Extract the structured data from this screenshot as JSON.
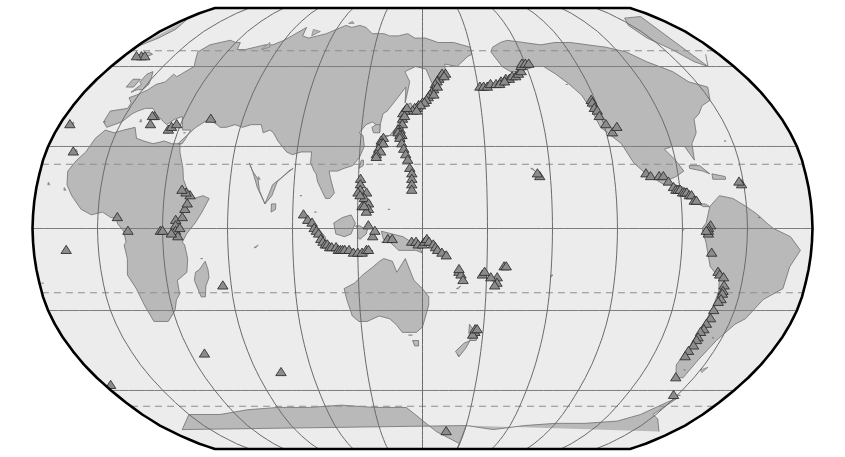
{
  "map": {
    "title": "World map of volcano locations",
    "projection": "Robinson",
    "center_longitude": 150,
    "background_color": "#ffffff",
    "ocean_color": "#ececec",
    "land_color": "#b9b9b9",
    "land_outline_color": "#6e6e6e",
    "frame_color": "#000000",
    "graticule_color": "#6a6a6a",
    "dashed_graticule_color": "#8d8d8d",
    "marker_fill_color": "#8c8c8c",
    "marker_outline_color": "#2b2b2b",
    "marker_symbol": "triangle",
    "marker_meaning": "volcano",
    "labels_visible": false,
    "legend_visible": false,
    "axis_tick_labels_visible": false
  },
  "graticule": {
    "latitude_interval_degrees": 30,
    "longitude_interval_degrees": 30,
    "solid_latitudes": [
      -60,
      -30,
      0,
      30,
      60
    ],
    "dashed_latitudes": [
      -66.5,
      -23.5,
      23.5,
      66.5
    ],
    "dashed_latitude_names": [
      "Antarctic Circle",
      "Tropic of Capricorn",
      "Tropic of Cancer",
      "Arctic Circle"
    ],
    "longitudes": [
      -180,
      -150,
      -120,
      -90,
      -60,
      -30,
      0,
      30,
      60,
      90,
      120,
      150,
      180
    ]
  },
  "chart_data": {
    "type": "scatter",
    "xlabel": "Longitude",
    "ylabel": "Latitude",
    "xlim": [
      -30,
      330
    ],
    "ylim": [
      -90,
      90
    ],
    "grid": true,
    "legend": "",
    "series": [
      {
        "name": "Volcanoes",
        "marker": "triangle",
        "regions": [
          {
            "region": "Kamchatka-Kuriles",
            "count": 22
          },
          {
            "region": "Japan",
            "count": 20
          },
          {
            "region": "Aleutians-Alaska",
            "count": 18
          },
          {
            "region": "Indonesia",
            "count": 26
          },
          {
            "region": "Philippines",
            "count": 12
          },
          {
            "region": "Melanesia-New Guinea",
            "count": 18
          },
          {
            "region": "Andes-South America",
            "count": 24
          },
          {
            "region": "Central America-Mexico",
            "count": 16
          },
          {
            "region": "Cascades-North America",
            "count": 8
          },
          {
            "region": "East Africa Rift",
            "count": 14
          },
          {
            "region": "Mediterranean",
            "count": 7
          },
          {
            "region": "Tonga-Vanuatu-Fiji",
            "count": 12
          },
          {
            "region": "New Zealand",
            "count": 4
          },
          {
            "region": "Atlantic Islands",
            "count": 5
          },
          {
            "region": "Indian Ocean",
            "count": 3
          }
        ]
      }
    ]
  }
}
